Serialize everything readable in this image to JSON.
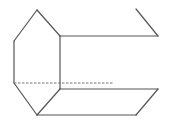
{
  "diagram": {
    "type": "geometric-solid",
    "colors": {
      "edge": "#555555",
      "hidden_edge": "#777777",
      "background": "#ffffff"
    },
    "vertices": {
      "top": [
        37,
        10
      ],
      "left_upper": [
        14,
        41
      ],
      "left_lower": [
        14,
        83
      ],
      "bottom": [
        37,
        115
      ],
      "right_upper": [
        60,
        36
      ],
      "right_lower": [
        60,
        89
      ],
      "far_top_start": [
        136,
        9
      ],
      "far_top_end": [
        158,
        36
      ],
      "far_bottom_upper": [
        158,
        89
      ],
      "far_bottom_lower": [
        136,
        115
      ],
      "hidden_end": [
        113,
        83
      ]
    },
    "edges": [
      {
        "id": "hex-top-left",
        "points": "37,10 14,41"
      },
      {
        "id": "hex-left",
        "points": "14,41 14,83"
      },
      {
        "id": "hex-bottom-left",
        "points": "14,83 37,115"
      },
      {
        "id": "hex-bottom-right",
        "points": "37,115 60,89"
      },
      {
        "id": "hex-right",
        "points": "60,89 60,36"
      },
      {
        "id": "hex-top-right",
        "points": "60,36 37,10"
      },
      {
        "id": "top-long-edge",
        "points": "60,36 158,36"
      },
      {
        "id": "top-far-slant",
        "points": "158,36 136,9"
      },
      {
        "id": "bottom-upper-edge",
        "points": "60,89 158,89"
      },
      {
        "id": "bottom-far-slant",
        "points": "158,89 136,115"
      },
      {
        "id": "bottom-lower-edge",
        "points": "37,115 136,115"
      }
    ],
    "hidden_edges": [
      {
        "id": "hidden-left-edge",
        "points": "14,83 113,83"
      }
    ]
  }
}
